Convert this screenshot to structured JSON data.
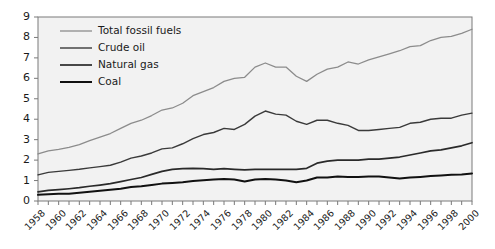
{
  "chart_data": {
    "type": "line",
    "title": "",
    "xlabel": "",
    "ylabel": "",
    "xlim": [
      1958,
      2000
    ],
    "ylim": [
      0,
      9
    ],
    "grid": false,
    "legend_position": "top-left",
    "y_ticks": [
      "0",
      "1",
      "2",
      "3",
      "4",
      "5",
      "6",
      "7",
      "8",
      "9"
    ],
    "x_ticks": [
      "1958",
      "1960",
      "1962",
      "1964",
      "1966",
      "1968",
      "1970",
      "1972",
      "1974",
      "1976",
      "1978",
      "1980",
      "1982",
      "1984",
      "1986",
      "1988",
      "1990",
      "1992",
      "1994",
      "1996",
      "1998",
      "2000"
    ],
    "x": [
      1958,
      1959,
      1960,
      1961,
      1962,
      1963,
      1964,
      1965,
      1966,
      1967,
      1968,
      1969,
      1970,
      1971,
      1972,
      1973,
      1974,
      1975,
      1976,
      1977,
      1978,
      1979,
      1980,
      1981,
      1982,
      1983,
      1984,
      1985,
      1986,
      1987,
      1988,
      1989,
      1990,
      1991,
      1992,
      1993,
      1994,
      1995,
      1996,
      1997,
      1998,
      1999,
      2000
    ],
    "series": [
      {
        "name": "Total fossil fuels",
        "color": "#8c8c8c",
        "width": 1.3,
        "values": [
          2.3,
          2.45,
          2.52,
          2.62,
          2.76,
          2.95,
          3.12,
          3.3,
          3.55,
          3.8,
          3.95,
          4.18,
          4.45,
          4.55,
          4.78,
          5.15,
          5.35,
          5.55,
          5.85,
          6.0,
          6.05,
          6.55,
          6.75,
          6.55,
          6.55,
          6.1,
          5.85,
          6.2,
          6.45,
          6.55,
          6.8,
          6.7,
          6.9,
          7.05,
          7.2,
          7.35,
          7.55,
          7.6,
          7.85,
          8.0,
          8.05,
          8.2,
          8.4
        ]
      },
      {
        "name": "Crude oil",
        "color": "#3a3a3a",
        "width": 1.4,
        "values": [
          1.28,
          1.4,
          1.45,
          1.5,
          1.55,
          1.62,
          1.68,
          1.75,
          1.9,
          2.1,
          2.2,
          2.35,
          2.55,
          2.6,
          2.8,
          3.05,
          3.25,
          3.35,
          3.55,
          3.5,
          3.75,
          4.15,
          4.4,
          4.25,
          4.2,
          3.9,
          3.75,
          3.95,
          3.95,
          3.8,
          3.7,
          3.45,
          3.45,
          3.5,
          3.55,
          3.6,
          3.8,
          3.85,
          4.0,
          4.05,
          4.05,
          4.2,
          4.3
        ]
      },
      {
        "name": "Natural gas",
        "color": "#2a2a2a",
        "width": 1.7,
        "values": [
          0.45,
          0.52,
          0.56,
          0.6,
          0.65,
          0.72,
          0.78,
          0.85,
          0.95,
          1.05,
          1.15,
          1.3,
          1.45,
          1.55,
          1.58,
          1.6,
          1.58,
          1.55,
          1.58,
          1.55,
          1.52,
          1.55,
          1.55,
          1.55,
          1.55,
          1.55,
          1.6,
          1.85,
          1.95,
          2.0,
          2.0,
          2.0,
          2.05,
          2.05,
          2.1,
          2.15,
          2.25,
          2.35,
          2.45,
          2.5,
          2.6,
          2.7,
          2.85
        ]
      },
      {
        "name": "Coal",
        "color": "#111111",
        "width": 2.0,
        "values": [
          0.3,
          0.33,
          0.35,
          0.36,
          0.4,
          0.45,
          0.5,
          0.55,
          0.6,
          0.68,
          0.72,
          0.78,
          0.85,
          0.88,
          0.92,
          0.98,
          1.02,
          1.05,
          1.08,
          1.05,
          0.95,
          1.05,
          1.08,
          1.05,
          1.0,
          0.92,
          1.0,
          1.15,
          1.15,
          1.2,
          1.18,
          1.18,
          1.2,
          1.2,
          1.15,
          1.1,
          1.15,
          1.18,
          1.22,
          1.25,
          1.28,
          1.3,
          1.35
        ]
      }
    ]
  },
  "legend": {
    "items": [
      {
        "label": "Total fossil fuels"
      },
      {
        "label": "Crude oil"
      },
      {
        "label": "Natural gas"
      },
      {
        "label": "Coal"
      }
    ]
  },
  "axes": {
    "plot_bg": "#f2f2f2",
    "frame_color": "#7a7a7a"
  }
}
